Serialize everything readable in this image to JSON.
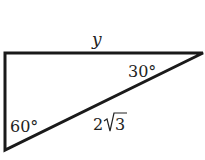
{
  "diagram": {
    "type": "right-triangle",
    "labels": {
      "top_side": "y",
      "angle_top_right": "30°",
      "angle_bottom_left": "60°",
      "hypotenuse_coeff": "2",
      "hypotenuse_radicand": "3"
    },
    "colors": {
      "stroke": "#1a1a1a",
      "text": "#222222"
    }
  }
}
